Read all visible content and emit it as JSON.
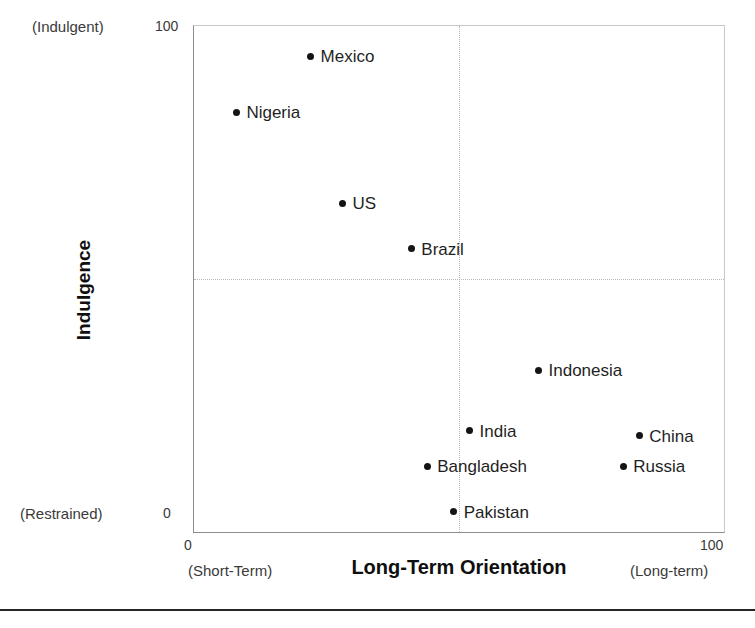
{
  "chart_data": {
    "type": "scatter",
    "title": "",
    "xlabel": "Long-Term Orientation",
    "ylabel": "Indulgence",
    "xlim": [
      0,
      100
    ],
    "ylim": [
      0,
      100
    ],
    "grid": true,
    "gridlines": {
      "x": [
        50
      ],
      "y": [
        50
      ]
    },
    "legend": "none",
    "xticks": [
      "0",
      "100"
    ],
    "yticks": [
      "0",
      "100"
    ],
    "x_axis_anchors": {
      "low": "(Short-Term)",
      "high": "(Long-term)"
    },
    "y_axis_anchors": {
      "low": "(Restrained)",
      "high": "(Indulgent)"
    },
    "points": [
      {
        "label": "Mexico",
        "x": 22,
        "y": 94,
        "label_side": "right"
      },
      {
        "label": "Nigeria",
        "x": 8,
        "y": 83,
        "label_side": "right"
      },
      {
        "label": "US",
        "x": 28,
        "y": 65,
        "label_side": "right"
      },
      {
        "label": "Brazil",
        "x": 41,
        "y": 56,
        "label_side": "right"
      },
      {
        "label": "Indonesia",
        "x": 65,
        "y": 32,
        "label_side": "right"
      },
      {
        "label": "India",
        "x": 52,
        "y": 20,
        "label_side": "right"
      },
      {
        "label": "China",
        "x": 84,
        "y": 19,
        "label_side": "right"
      },
      {
        "label": "Bangladesh",
        "x": 44,
        "y": 13,
        "label_side": "right"
      },
      {
        "label": "Russia",
        "x": 81,
        "y": 13,
        "label_side": "right"
      },
      {
        "label": "Pakistan",
        "x": 49,
        "y": 4,
        "label_side": "right"
      }
    ]
  },
  "axes": {
    "y_tick_top": "100",
    "y_tick_bottom": "0",
    "x_tick_left": "0",
    "x_tick_right": "100",
    "y_title": "Indulgence",
    "x_title": "Long-Term Orientation",
    "y_anchor_top": "(Indulgent)",
    "y_anchor_bottom": "(Restrained)",
    "x_anchor_left": "(Short-Term)",
    "x_anchor_right": "(Long-term)"
  },
  "colors": {
    "point": "#141414",
    "text": "#1f1f1f",
    "frame": "#8d8d8d",
    "grid": "#b9b9b9",
    "rule": "#262626"
  }
}
